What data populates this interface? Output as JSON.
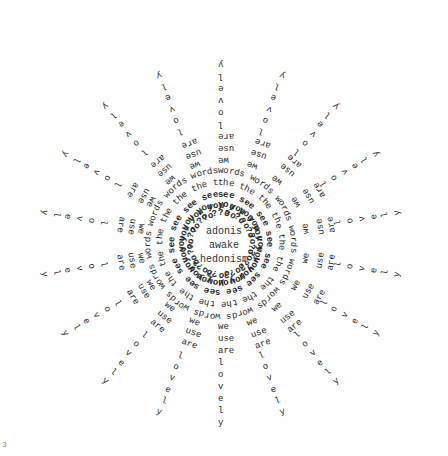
{
  "poem": {
    "center_lines": [
      "adonis",
      "awake",
      "hedonism"
    ],
    "rings": [
      {
        "word": "?o",
        "radius": 30,
        "weight": "bold",
        "overtyped": true
      },
      {
        "word": "you",
        "radius": 38,
        "weight": "bold",
        "overtyped": true
      },
      {
        "word": "see",
        "radius": 48,
        "weight": "bold",
        "overtyped": false
      },
      {
        "word": "the",
        "radius": 60,
        "weight": "normal",
        "overtyped": false
      },
      {
        "word": "words",
        "radius": 72,
        "weight": "normal",
        "overtyped": false
      }
    ],
    "ray_words": [
      "we",
      "use",
      "are",
      "l",
      "o",
      "v",
      "e",
      "l",
      "y"
    ],
    "ray_count": 18,
    "ray_start_radius": 84,
    "ray_step": 12
  },
  "page_number": "3",
  "colors": {
    "ink": "#2a2a2a",
    "paper": "#fefefe"
  }
}
